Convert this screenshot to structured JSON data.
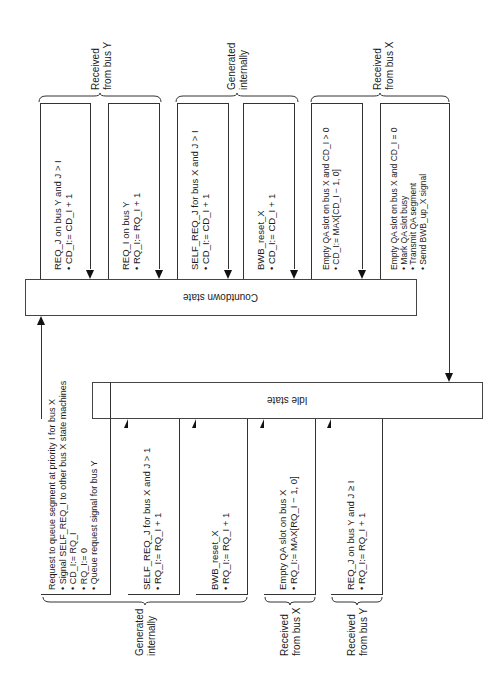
{
  "states": {
    "countdown": "Countdown state",
    "idle": "Idle state"
  },
  "top_groups": [
    {
      "label_line1": "Received",
      "label_line2": "from bus Y"
    },
    {
      "label_line1": "Generated",
      "label_line2": "internally"
    },
    {
      "label_line1": "Received",
      "label_line2": "from bus X"
    }
  ],
  "top_transitions": [
    {
      "title": "REQ_J on bus Y and J > I",
      "actions": [
        "CD_I:= CD_I + 1"
      ]
    },
    {
      "title": "REQ_I on bus Y",
      "actions": [
        "RQ_I:= RQ_I + 1"
      ]
    },
    {
      "title": "SELF_REQ_J for bus X and J > I",
      "actions": [
        "CD_I:= CD_I + 1"
      ]
    },
    {
      "title": "BWB_reset_X",
      "actions": [
        "CD_I:= CD_I + 1"
      ]
    },
    {
      "title": "Empty QA slot on bus X and CD_I > 0",
      "actions": [
        "CD_I:= MAX[CD_I − 1, 0]"
      ]
    },
    {
      "title": "Empty QA slot on bus X and CD_I = 0",
      "actions": [
        "Mark QA slot busy",
        "Transmit QA segment",
        "Send BWB_up_X signal"
      ]
    }
  ],
  "bottom_transitions": [
    {
      "title": "Request to queue segment at priority I for bus X",
      "actions": [
        "Signal SELF_REQ_I to other bus X state machines",
        "CD_I:= RQ_I",
        "RQ_I:= 0",
        "Queue request signal for bus Y"
      ]
    },
    {
      "title": "SELF_REQ_J for bus X and J > 1",
      "actions": [
        "RQ_I:= RQ_I + 1"
      ]
    },
    {
      "title": "BWB_reset_X",
      "actions": [
        "RQ_I:= RQ_I + 1"
      ]
    },
    {
      "title": "Empty QA slot on bus X",
      "actions": [
        "RQ_I:= MAX[RQ_I − 1, 0]"
      ]
    },
    {
      "title": "REQ_J on bus Y and J ≥ I",
      "actions": [
        "RQ_I:= RQ_I + 1"
      ]
    }
  ],
  "bottom_groups": [
    {
      "label_line1": "Generated",
      "label_line2": "internally"
    },
    {
      "label_line1": "Received",
      "label_line2": "from bus X"
    },
    {
      "label_line1": "Received",
      "label_line2": "from bus Y"
    }
  ]
}
